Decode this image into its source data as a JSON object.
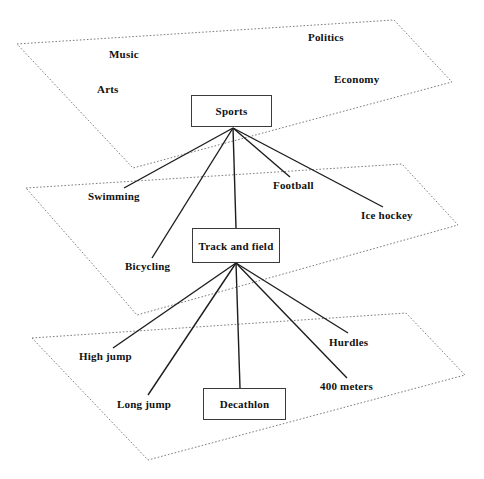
{
  "diagram": {
    "colors": {
      "background": "#ffffff",
      "plane_outline": "#6e6e6e",
      "box_border": "#3a3a3a",
      "connector": "#1d1d1d",
      "text": "#111111"
    },
    "planes": [
      {
        "id": "plane-top",
        "name": "top-domain-plane",
        "points": "17,44 394,20 452,82 133,168",
        "labels": [
          {
            "text": "Politics",
            "x": 308,
            "y": 31
          },
          {
            "text": "Music",
            "x": 109,
            "y": 48
          },
          {
            "text": "Economy",
            "x": 334,
            "y": 73
          },
          {
            "text": "Arts",
            "x": 97,
            "y": 83
          }
        ]
      },
      {
        "id": "plane-middle",
        "name": "middle-sports-plane",
        "points": "26,188 402,164 458,225 137,315",
        "labels": [
          {
            "text": "Swimming",
            "x": 88,
            "y": 190
          },
          {
            "text": "Football",
            "x": 273,
            "y": 179
          },
          {
            "text": "Ice hockey",
            "x": 361,
            "y": 209
          },
          {
            "text": "Bicycling",
            "x": 125,
            "y": 260
          }
        ]
      },
      {
        "id": "plane-bottom",
        "name": "bottom-trackfield-plane",
        "points": "32,338 406,313 465,375 148,460",
        "labels": [
          {
            "text": "High jump",
            "x": 79,
            "y": 350
          },
          {
            "text": "Hurdles",
            "x": 329,
            "y": 336
          },
          {
            "text": "Long jump",
            "x": 117,
            "y": 398
          },
          {
            "text": "400 meters",
            "x": 320,
            "y": 380
          }
        ]
      }
    ],
    "boxes": [
      {
        "id": "box-sports",
        "name": "sports-node",
        "label": "Sports",
        "x": 191,
        "y": 95,
        "w": 81,
        "h": 32
      },
      {
        "id": "box-track-field",
        "name": "track-and-field-node",
        "label": "Track and field",
        "x": 192,
        "y": 228,
        "w": 88,
        "h": 35
      },
      {
        "id": "box-decathlon",
        "name": "decathlon-node",
        "label": "Decathlon",
        "x": 203,
        "y": 388,
        "w": 83,
        "h": 32
      }
    ],
    "connectors": {
      "sports_hub": {
        "x": 233,
        "y": 128
      },
      "trackfield_hub": {
        "x": 236,
        "y": 263
      },
      "sports_edges": [
        {
          "name": "edge-sports-swimming",
          "x2": 124,
          "y2": 188
        },
        {
          "name": "edge-sports-bicycling",
          "x2": 152,
          "y2": 258
        },
        {
          "name": "edge-sports-trackfield",
          "x2": 236,
          "y2": 228
        },
        {
          "name": "edge-sports-football",
          "x2": 290,
          "y2": 177
        },
        {
          "name": "edge-sports-icehockey",
          "x2": 383,
          "y2": 207
        }
      ],
      "trackfield_edges": [
        {
          "name": "edge-trackfield-highjump",
          "x2": 113,
          "y2": 348
        },
        {
          "name": "edge-trackfield-longjump",
          "x2": 148,
          "y2": 395
        },
        {
          "name": "edge-trackfield-decathlon",
          "x2": 240,
          "y2": 388
        },
        {
          "name": "edge-trackfield-hurdles",
          "x2": 348,
          "y2": 333
        },
        {
          "name": "edge-trackfield-400meters",
          "x2": 347,
          "y2": 378
        }
      ]
    }
  }
}
